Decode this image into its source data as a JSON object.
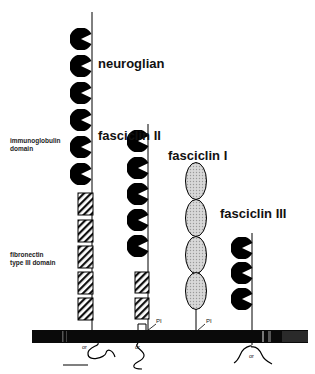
{
  "figure": {
    "proteins": [
      {
        "name": "neuroglian",
        "ig_domains": 6,
        "fn3_domains": 5,
        "anchor": "transmembrane",
        "cytoplasmic_label": "or"
      },
      {
        "name": "fasciclin II",
        "ig_domains": 5,
        "fn3_domains": 2,
        "anchor": "PI or transmembrane",
        "pi_label": "PI",
        "cytoplasmic_label": "or"
      },
      {
        "name": "fasciclin I",
        "fasciclin_domains": 4,
        "anchor": "PI",
        "pi_label": "PI"
      },
      {
        "name": "fasciclin III",
        "ig_domains": 3,
        "anchor": "transmembrane",
        "cytoplasmic_label": "or"
      }
    ],
    "legend": {
      "ig_label_line1": "immunoglobulin",
      "ig_label_line2": "domain",
      "fn_label_line1": "fibronectin",
      "fn_label_line2": "type III domain"
    },
    "labels": {
      "neuroglian": "neuroglian",
      "fasII": "fasciclin II",
      "fasI": "fasciclin I",
      "fasIII": "fasciclin III",
      "pi1": "PI",
      "pi2": "PI",
      "or1": "or",
      "or2": "or",
      "or3": "or"
    }
  }
}
